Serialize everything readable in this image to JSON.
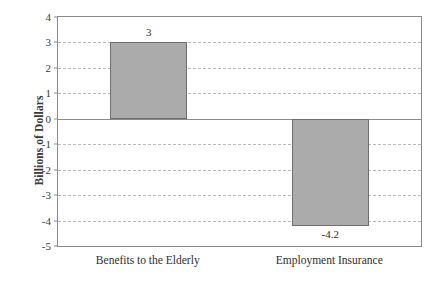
{
  "chart_data": {
    "type": "bar",
    "title": "",
    "xlabel": "",
    "ylabel": "Billions of Dollars",
    "categories": [
      "Benefits to the Elderly",
      "Employment Insurance"
    ],
    "values": [
      3,
      -4.2
    ],
    "value_labels": [
      "3",
      "-4.2"
    ],
    "ylim": [
      -5,
      4
    ],
    "ytick_step": 1,
    "yticks": [
      4,
      3,
      2,
      1,
      0,
      -1,
      -2,
      -3,
      -4,
      -5
    ],
    "ytick_labels": [
      "4",
      "3",
      "2",
      "1",
      "0",
      "-1",
      "-2",
      "-3",
      "-4",
      "-5"
    ],
    "grid": true,
    "grid_style": "dashed-horizontal",
    "legend": null,
    "legend_position": "none",
    "zero_line": 0,
    "series": [
      {
        "name": "Billions of Dollars",
        "values": [
          3,
          -4.2
        ]
      }
    ],
    "colors": {
      "bar_fill": "#ababab",
      "bar_border": "#6e6e6e",
      "gridline": "#b9b9b9",
      "axis": "#8a8a8a",
      "text": "#2e2e2e",
      "background": "#ffffff"
    }
  }
}
